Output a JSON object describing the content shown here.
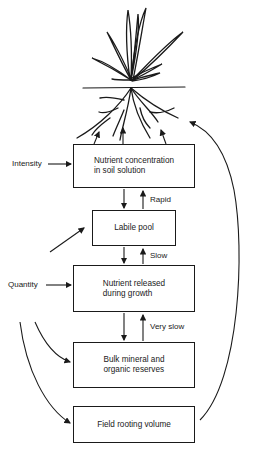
{
  "diagram": {
    "boxes": {
      "concentration": "Nutrient concentration\nin soil solution",
      "labile": "Labile pool",
      "released": "Nutrient released\nduring growth",
      "bulk": "Bulk mineral and\norganic reserves",
      "rooting": "Field rooting volume"
    },
    "rates": {
      "rapid": "Rapid",
      "slow": "Slow",
      "very_slow": "Very slow"
    },
    "side_labels": {
      "intensity": "Intensity",
      "quantity": "Quantity"
    },
    "illustration": "plant-with-roots",
    "line_color": "#1a1a1a"
  }
}
